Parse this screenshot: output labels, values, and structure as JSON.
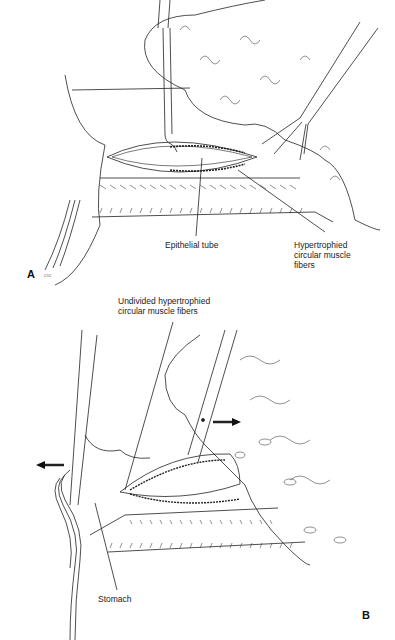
{
  "figure": {
    "panels": [
      {
        "id": "A",
        "letter": "A",
        "signature": "csc",
        "labels": {
          "epithelial_tube": "Epithelial tube",
          "hypertrophied_fibers": [
            "Hypertrophied",
            "circular muscle",
            "fibers"
          ]
        }
      },
      {
        "id": "B",
        "letter": "B",
        "labels": {
          "undivided_fibers": [
            "Undivided hypertrophied",
            "circular muscle fibers"
          ],
          "stomach": "Stomach"
        },
        "arrows": [
          "left",
          "right"
        ]
      }
    ]
  }
}
